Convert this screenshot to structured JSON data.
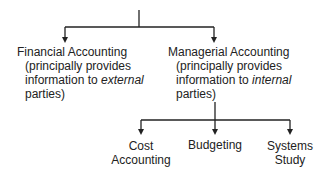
{
  "diagram": {
    "type": "hierarchy",
    "nodes": {
      "financial": {
        "title": "Financial Accounting",
        "desc_line1": "(principally provides",
        "desc_line2_prefix": "information to ",
        "desc_line2_emph": "external",
        "desc_line3": "parties)"
      },
      "managerial": {
        "title": "Managerial Accounting",
        "desc_line1": "(principally provides",
        "desc_line2_prefix": "information to ",
        "desc_line2_emph": "internal",
        "desc_line3": "parties)"
      },
      "cost_accounting": {
        "line1": "Cost",
        "line2": "Accounting"
      },
      "budgeting": {
        "line1": "Budgeting"
      },
      "systems_study": {
        "line1": "Systems",
        "line2": "Study"
      }
    },
    "edges": [
      {
        "from": "root",
        "to": "financial"
      },
      {
        "from": "root",
        "to": "managerial"
      },
      {
        "from": "managerial",
        "to": "cost_accounting"
      },
      {
        "from": "managerial",
        "to": "budgeting"
      },
      {
        "from": "managerial",
        "to": "systems_study"
      }
    ],
    "line_color": "#222222"
  }
}
